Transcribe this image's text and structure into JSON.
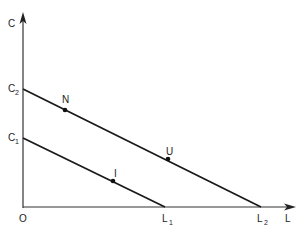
{
  "diagram": {
    "type": "budget-constraint",
    "axes": {
      "y": {
        "label": "C"
      },
      "x": {
        "label": "L"
      },
      "origin": {
        "label": "O"
      }
    },
    "intercepts": {
      "c1": {
        "main": "C",
        "sub": "1"
      },
      "c2": {
        "main": "C",
        "sub": "2"
      },
      "l1": {
        "main": "L",
        "sub": "1"
      },
      "l2": {
        "main": "L",
        "sub": "2"
      }
    },
    "lines": [
      {
        "name": "lower-budget-line",
        "from": "C1",
        "to": "L1"
      },
      {
        "name": "upper-budget-line",
        "from": "C2",
        "to": "L2"
      }
    ],
    "points": [
      {
        "id": "N",
        "label": "N",
        "on": "upper-budget-line"
      },
      {
        "id": "U",
        "label": "U",
        "on": "upper-budget-line"
      },
      {
        "id": "I",
        "label": "I",
        "on": "lower-budget-line"
      }
    ],
    "colors": {
      "line": "#1a1a1a",
      "background": "#ffffff"
    }
  }
}
